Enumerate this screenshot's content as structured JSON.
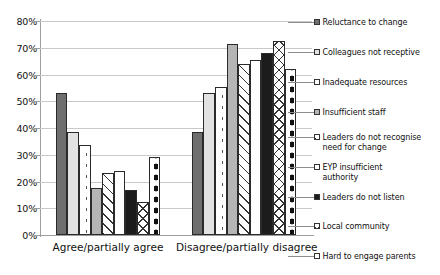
{
  "chart_data": {
    "type": "bar",
    "title": "",
    "xlabel": "",
    "ylabel": "",
    "ylim": [
      0,
      80
    ],
    "ytick_labels": [
      "0%",
      "10%",
      "20%",
      "30%",
      "40%",
      "50%",
      "60%",
      "70%",
      "80%"
    ],
    "ytick_values": [
      0,
      10,
      20,
      30,
      40,
      50,
      60,
      70,
      80
    ],
    "grid": true,
    "legend_position": "right",
    "categories": [
      "Agree/partially agree",
      "Disagree/partially disagree"
    ],
    "series": [
      {
        "name": "Reluctance to change",
        "fill": "dark-gray-solid",
        "values": [
          53,
          38.5
        ]
      },
      {
        "name": "Colleagues not receptive",
        "fill": "light-gray-solid",
        "values": [
          38.5,
          53
        ]
      },
      {
        "name": "Inadequate resources",
        "fill": "white-fine-dots",
        "values": [
          33.5,
          55.5
        ]
      },
      {
        "name": "Insufficient staff",
        "fill": "medium-gray-solid",
        "values": [
          17.5,
          71.5
        ]
      },
      {
        "name": "Leaders do not recognise\nneed for change",
        "fill": "diagonal-hatch",
        "values": [
          23,
          64
        ]
      },
      {
        "name": "EYP insufficient\nauthority",
        "fill": "white-solid",
        "values": [
          24,
          65.5
        ]
      },
      {
        "name": "Leaders do not listen",
        "fill": "black-solid",
        "values": [
          17,
          68
        ]
      },
      {
        "name": "Local community",
        "fill": "crosshatch",
        "values": [
          12.5,
          72.5
        ]
      },
      {
        "name": "Hard to engage parents",
        "fill": "white-big-dots",
        "values": [
          29,
          62
        ]
      }
    ]
  }
}
